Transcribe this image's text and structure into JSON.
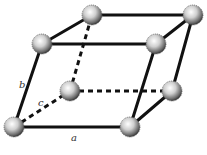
{
  "diagram": {
    "atoms": [
      {
        "id": "top-back-left"
      },
      {
        "id": "top-back-right"
      },
      {
        "id": "top-front-left"
      },
      {
        "id": "top-front-right"
      },
      {
        "id": "back-bottom-left",
        "hidden": true
      },
      {
        "id": "back-bottom-right"
      },
      {
        "id": "bottom-front-left"
      },
      {
        "id": "bottom-front-right"
      }
    ],
    "edges": [
      {
        "from": "top-back-left",
        "to": "top-back-right",
        "hidden": false
      },
      {
        "from": "top-front-left",
        "to": "top-front-right",
        "hidden": false
      },
      {
        "from": "top-front-left",
        "to": "top-back-left",
        "hidden": false
      },
      {
        "from": "top-front-right",
        "to": "top-back-right",
        "hidden": false
      },
      {
        "from": "bottom-front-left",
        "to": "bottom-front-right",
        "hidden": false
      },
      {
        "from": "bottom-front-left",
        "to": "top-front-left",
        "hidden": false
      },
      {
        "from": "bottom-front-right",
        "to": "top-front-right",
        "hidden": false
      },
      {
        "from": "bottom-front-right",
        "to": "back-bottom-right",
        "hidden": false
      },
      {
        "from": "back-bottom-right",
        "to": "top-back-right",
        "hidden": false
      },
      {
        "from": "bottom-front-left",
        "to": "back-bottom-left",
        "hidden": true
      },
      {
        "from": "back-bottom-left",
        "to": "back-bottom-right",
        "hidden": true
      },
      {
        "from": "back-bottom-left",
        "to": "top-back-left",
        "hidden": true
      }
    ],
    "labels": {
      "a": "a",
      "b": "b",
      "c": "c"
    }
  }
}
